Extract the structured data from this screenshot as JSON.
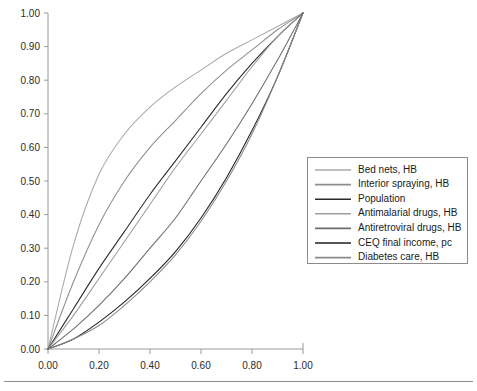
{
  "chart_data": {
    "type": "line",
    "title": "",
    "subtitle": "",
    "xlabel": "",
    "ylabel": "",
    "xlim": [
      0.0,
      1.0
    ],
    "ylim": [
      0.0,
      1.0
    ],
    "grid": false,
    "legend_position": "right",
    "x_ticks": [
      "0.00",
      "0.20",
      "0.40",
      "0.60",
      "0.80",
      "1.00"
    ],
    "x_tick_values": [
      0.0,
      0.2,
      0.4,
      0.6,
      0.8,
      1.0
    ],
    "y_ticks": [
      "0.00",
      "0.10",
      "0.20",
      "0.30",
      "0.40",
      "0.50",
      "0.60",
      "0.70",
      "0.80",
      "0.90",
      "1.00"
    ],
    "y_tick_values": [
      0.0,
      0.1,
      0.2,
      0.3,
      0.4,
      0.5,
      0.6,
      0.7,
      0.8,
      0.9,
      1.0
    ],
    "x": [
      0.0,
      0.1,
      0.2,
      0.3,
      0.4,
      0.5,
      0.6,
      0.7,
      0.8,
      0.9,
      1.0
    ],
    "series": [
      {
        "name": "Bed nets, HB",
        "color": "#a8a8a8",
        "values": [
          0.0,
          0.31,
          0.52,
          0.64,
          0.72,
          0.78,
          0.83,
          0.88,
          0.92,
          0.96,
          1.0
        ]
      },
      {
        "name": "Interior spraying, HB",
        "color": "#8e8e8e",
        "values": [
          0.0,
          0.2,
          0.37,
          0.5,
          0.6,
          0.68,
          0.76,
          0.83,
          0.89,
          0.95,
          1.0
        ]
      },
      {
        "name": "Population",
        "color": "#2a2a2a",
        "values": [
          0.0,
          0.12,
          0.24,
          0.35,
          0.46,
          0.56,
          0.66,
          0.76,
          0.85,
          0.93,
          1.0
        ]
      },
      {
        "name": "Antimalarial drugs, HB",
        "color": "#9c9c9c",
        "values": [
          0.0,
          0.1,
          0.21,
          0.32,
          0.43,
          0.54,
          0.64,
          0.74,
          0.84,
          0.93,
          1.0
        ]
      },
      {
        "name": "Antiretroviral drugs, HB",
        "color": "#6e6e6e",
        "values": [
          0.0,
          0.06,
          0.13,
          0.21,
          0.3,
          0.39,
          0.5,
          0.61,
          0.73,
          0.86,
          1.0
        ]
      },
      {
        "name": "CEQ final income, pc",
        "color": "#1f1f1f",
        "values": [
          0.0,
          0.03,
          0.08,
          0.14,
          0.21,
          0.29,
          0.39,
          0.51,
          0.65,
          0.81,
          1.0
        ]
      },
      {
        "name": "Diabetes care, HB",
        "color": "#8a8a8a",
        "values": [
          0.0,
          0.03,
          0.07,
          0.13,
          0.2,
          0.28,
          0.38,
          0.5,
          0.64,
          0.81,
          1.0
        ]
      }
    ]
  },
  "legend": {
    "entries": [
      {
        "label": "Bed nets, HB"
      },
      {
        "label": "Interior spraying, HB"
      },
      {
        "label": "Population"
      },
      {
        "label": "Antimalarial drugs, HB"
      },
      {
        "label": "Antiretroviral drugs, HB"
      },
      {
        "label": "CEQ final income, pc"
      },
      {
        "label": "Diabetes care, HB"
      }
    ]
  }
}
